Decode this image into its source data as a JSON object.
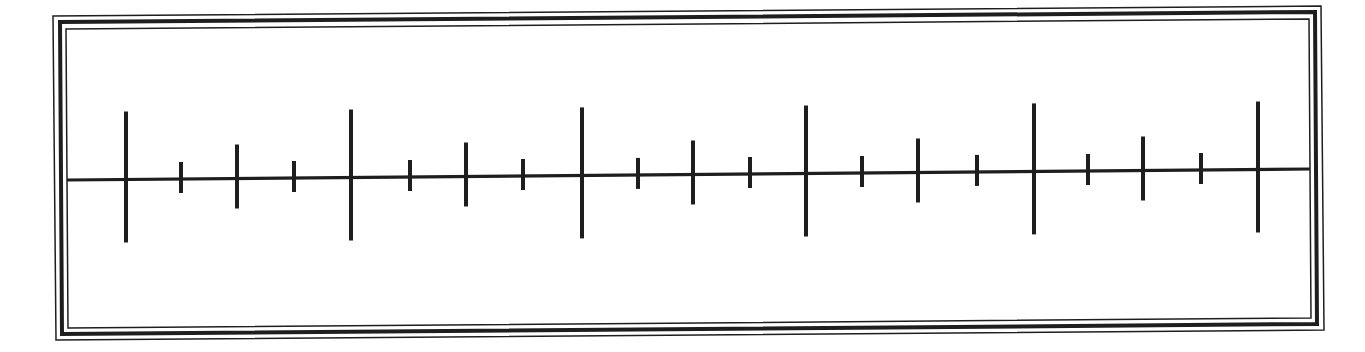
{
  "diagram": {
    "type": "number-line",
    "labels_visible": false,
    "colors": {
      "background": "#ffffff",
      "ink": "#1e1e1e"
    },
    "frame": {
      "style": "triple-line border",
      "outer": {
        "tl": [
          53,
          16
        ],
        "tr": [
          1321,
          6
        ],
        "br": [
          1324,
          330
        ],
        "bl": [
          56,
          340
        ],
        "stroke": 1.5
      },
      "middle": {
        "tl": [
          60,
          22
        ],
        "tr": [
          1315,
          12
        ],
        "br": [
          1317,
          324
        ],
        "bl": [
          62,
          334
        ],
        "stroke": 4
      },
      "inner": {
        "tl": [
          66,
          29
        ],
        "tr": [
          1309,
          19
        ],
        "br": [
          1311,
          318
        ],
        "bl": [
          68,
          328
        ],
        "stroke": 1.5
      }
    },
    "axis": {
      "start": [
        67,
        180
      ],
      "end": [
        1310,
        169
      ],
      "stroke": 3.2
    },
    "tick_pattern": [
      "major",
      "small",
      "medium",
      "small"
    ],
    "tick_lengths": {
      "major": {
        "up": 68,
        "down": 63
      },
      "medium": {
        "up": 34,
        "down": 30
      },
      "small": {
        "up": 17,
        "down": 14
      }
    },
    "ticks": [
      {
        "x": 126,
        "kind": "major"
      },
      {
        "x": 181,
        "kind": "small"
      },
      {
        "x": 237,
        "kind": "medium"
      },
      {
        "x": 294,
        "kind": "small"
      },
      {
        "x": 351,
        "kind": "major"
      },
      {
        "x": 410,
        "kind": "small"
      },
      {
        "x": 466,
        "kind": "medium"
      },
      {
        "x": 523,
        "kind": "small"
      },
      {
        "x": 582,
        "kind": "major"
      },
      {
        "x": 638,
        "kind": "small"
      },
      {
        "x": 693,
        "kind": "medium"
      },
      {
        "x": 750,
        "kind": "small"
      },
      {
        "x": 806,
        "kind": "major"
      },
      {
        "x": 862,
        "kind": "small"
      },
      {
        "x": 918,
        "kind": "medium"
      },
      {
        "x": 977,
        "kind": "small"
      },
      {
        "x": 1034,
        "kind": "major"
      },
      {
        "x": 1088,
        "kind": "small"
      },
      {
        "x": 1143,
        "kind": "medium"
      },
      {
        "x": 1201,
        "kind": "small"
      },
      {
        "x": 1258,
        "kind": "major"
      }
    ],
    "counts": {
      "total_ticks": 21,
      "major_ticks": 5,
      "medium_ticks": 4,
      "small_ticks": 8
    }
  }
}
